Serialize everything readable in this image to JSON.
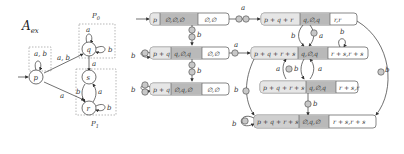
{
  "automaton": {
    "title": "A",
    "title_sub": "ex",
    "partitions": [
      {
        "label": "P",
        "sub": "0"
      },
      {
        "label": "P",
        "sub": "1"
      }
    ],
    "states": [
      "p",
      "q",
      "s",
      "r"
    ],
    "edges": {
      "p_loop": "a, b",
      "p_q": "a, b",
      "p_r": "a",
      "q_loop": "a",
      "q_loop_right": "b",
      "q_s": "a",
      "s_r": "b",
      "r_s": "a",
      "r_loop": "b"
    }
  },
  "graph": {
    "nodes": [
      {
        "id": "n1",
        "left": "p",
        "mid": "∅,∅,∅",
        "right": "∅,∅"
      },
      {
        "id": "n2",
        "left": "p + q + r",
        "mid": "q,∅,q",
        "right": "r,r"
      },
      {
        "id": "n3",
        "left": "p + q",
        "mid": "q,∅,q",
        "right": "∅,∅"
      },
      {
        "id": "n4",
        "left": "p + q + r + s",
        "mid": "q,∅,q",
        "right": "r + s,r + s"
      },
      {
        "id": "n5",
        "left": "p + q + r + s",
        "mid": "q,∅,q",
        "right": "r + s,r"
      },
      {
        "id": "n6",
        "left": "p + q",
        "mid": "∅,q,∅",
        "right": "∅,∅"
      },
      {
        "id": "n7",
        "left": "p + q + r + s",
        "mid": "∅,q,∅",
        "right": "r + s,r + s"
      }
    ],
    "edge_labels": {
      "n1_n2": "a",
      "n1_n3": "b",
      "n3_loop": "b",
      "n3_n4": "a",
      "n3_n6": "b",
      "n6_loop": "b",
      "n2_n4_b": "b",
      "n2_n4_a": "a",
      "n4_loop": "b",
      "n4_n5_a": "a",
      "n4_n5_b": "b",
      "n5_n4": "a",
      "n5_n7": "b",
      "n2_n7": "b",
      "n4_n7": "b",
      "n7_loop": "b"
    },
    "colors": {
      "mid_fill": "#b9b9b9",
      "left_fill": "#e6e6e6",
      "left_fill_dark": "#cfcfcf",
      "right_fill": "#ffffff",
      "stroke": "#555555",
      "edge": "#444444"
    }
  }
}
